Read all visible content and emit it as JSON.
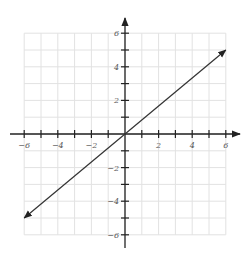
{
  "chart_data": {
    "type": "line",
    "title": "",
    "xlabel": "",
    "ylabel": "",
    "xlim": [
      -6,
      6
    ],
    "ylim": [
      -6,
      6
    ],
    "grid": true,
    "x_tick_labels": [
      "-6",
      "-4",
      "-2",
      "2",
      "4",
      "6"
    ],
    "y_tick_labels": [
      "6",
      "4",
      "2",
      "-2",
      "-4",
      "-6"
    ],
    "series": [
      {
        "name": "line",
        "x": [
          -6,
          6
        ],
        "y": [
          -5,
          5
        ],
        "arrows": "both"
      }
    ],
    "colors": {
      "grid": "#e2e2e2",
      "axis": "#222222",
      "line": "#333333"
    }
  }
}
